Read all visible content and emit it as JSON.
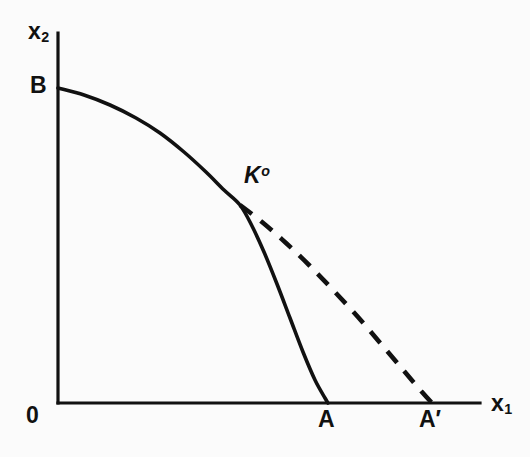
{
  "figure": {
    "background_color": "#fbfbfb",
    "ink_color": "#111111"
  },
  "labels": {
    "y_axis": "x",
    "y_axis_sub": "2",
    "x_axis": "x",
    "x_axis_sub": "1",
    "origin": "0",
    "y_intercept": "B",
    "kink": "K",
    "kink_sup": "o",
    "x_intercept_solid": "A",
    "x_intercept_dashed": "A′"
  },
  "chart_data": {
    "type": "line",
    "title": "",
    "xlabel": "x1",
    "ylabel": "x2",
    "grid": false,
    "legend": null,
    "axis_pixels": {
      "origin": [
        58,
        403
      ],
      "y_axis_top": [
        58,
        33
      ],
      "x_axis_right": [
        480,
        403
      ]
    },
    "annotations": [
      {
        "text": "B",
        "point": [
          58,
          88
        ],
        "description": "y-intercept of solid transformation curve"
      },
      {
        "text": "Kº",
        "point": [
          240,
          205
        ],
        "description": "kink point where dashed branch departs from solid curve"
      },
      {
        "text": "A",
        "point": [
          328,
          403
        ],
        "description": "x-intercept of solid transformation curve"
      },
      {
        "text": "A′",
        "point": [
          432,
          403
        ],
        "description": "x-intercept of dashed extension curve"
      },
      {
        "text": "0",
        "point": [
          58,
          403
        ],
        "description": "origin"
      }
    ],
    "series": [
      {
        "name": "solid-transformation-curve",
        "style": "solid",
        "path_pixels": [
          [
            58,
            88
          ],
          [
            84,
            95
          ],
          [
            110,
            105
          ],
          [
            136,
            118
          ],
          [
            160,
            133
          ],
          [
            184,
            152
          ],
          [
            206,
            172
          ],
          [
            224,
            190
          ],
          [
            240,
            205
          ],
          [
            252,
            226
          ],
          [
            264,
            252
          ],
          [
            277,
            284
          ],
          [
            290,
            318
          ],
          [
            303,
            352
          ],
          [
            315,
            380
          ],
          [
            325,
            398
          ],
          [
            328,
            403
          ]
        ]
      },
      {
        "name": "dashed-extension-curve",
        "style": "dashed",
        "path_pixels": [
          [
            240,
            205
          ],
          [
            262,
            222
          ],
          [
            286,
            243
          ],
          [
            310,
            266
          ],
          [
            334,
            291
          ],
          [
            358,
            317
          ],
          [
            382,
            345
          ],
          [
            404,
            371
          ],
          [
            422,
            392
          ],
          [
            432,
            403
          ]
        ]
      }
    ]
  }
}
